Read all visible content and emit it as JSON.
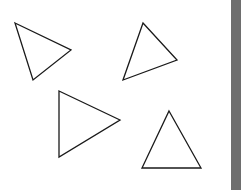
{
  "canvas": {
    "background": "#ffffff",
    "stroke": "#1a1a1a",
    "stroke_width": 1.3,
    "shapes": [
      {
        "type": "triangle",
        "points": "15,23 71,50 33,80"
      },
      {
        "type": "triangle",
        "points": "143,23 177,60 123,80"
      },
      {
        "type": "triangle",
        "points": "59,91 120,120 59,157"
      },
      {
        "type": "triangle",
        "points": "169,111 201,168 142,168"
      }
    ]
  },
  "side_bar": {
    "color": "#6e6e6e"
  }
}
